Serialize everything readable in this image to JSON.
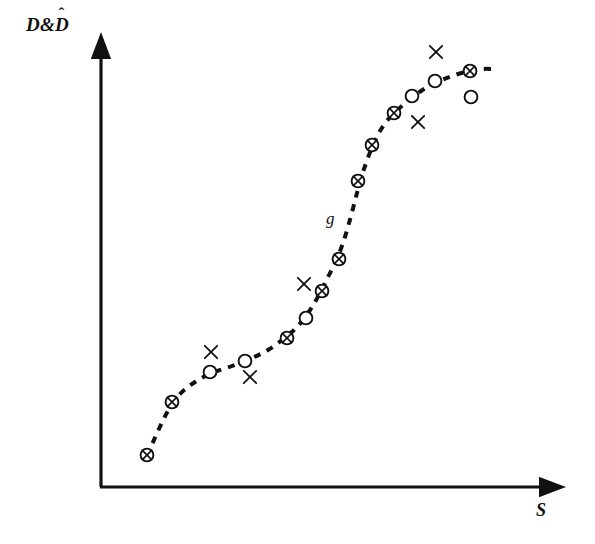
{
  "figure": {
    "width": 595,
    "height": 544,
    "background_color": "#ffffff",
    "ink_color": "#111111"
  },
  "labels": {
    "y_axis": "D&D",
    "y_axis_full": "D&D̂",
    "y_axis_base": "D&",
    "y_axis_hatted_symbol": "D",
    "hat_glyph": "ˆ",
    "x_axis": "S",
    "curve": "g"
  },
  "chart_data": {
    "type": "scatter",
    "title": "",
    "xlabel": "S",
    "ylabel": "D&D̂",
    "grid": false,
    "legend": "none",
    "axes": {
      "style": "arrow",
      "origin_px": [
        100,
        487
      ],
      "y_tip_px": [
        100,
        45
      ],
      "x_tip_px": [
        553,
        487
      ],
      "ticks": [],
      "tick_labels": [],
      "xlim": null,
      "ylim": null
    },
    "annotations": [
      {
        "text": "g",
        "x_px": 334,
        "y_px": 221,
        "style": "italic"
      }
    ],
    "series": [
      {
        "name": "D (fitted curve g)",
        "type": "line",
        "linestyle": "dashed",
        "marker": "none",
        "color": "#111111",
        "points_px": [
          [
            147,
            456
          ],
          [
            158,
            431
          ],
          [
            168,
            411
          ],
          [
            180,
            394
          ],
          [
            195,
            382
          ],
          [
            212,
            373
          ],
          [
            232,
            366
          ],
          [
            252,
            358
          ],
          [
            268,
            350
          ],
          [
            282,
            340
          ],
          [
            294,
            330
          ],
          [
            303,
            320
          ],
          [
            312,
            307
          ],
          [
            320,
            293
          ],
          [
            328,
            277
          ],
          [
            336,
            261
          ],
          [
            344,
            240
          ],
          [
            351,
            216
          ],
          [
            357,
            193
          ],
          [
            363,
            172
          ],
          [
            371,
            150
          ],
          [
            380,
            131
          ],
          [
            392,
            115
          ],
          [
            408,
            101
          ],
          [
            424,
            89
          ],
          [
            442,
            80
          ],
          [
            458,
            74
          ],
          [
            470,
            71
          ],
          [
            483,
            69
          ],
          [
            492,
            69
          ]
        ]
      },
      {
        "name": "Measured and predicted coincident (circle-with-cross)",
        "type": "scatter",
        "marker": "circle-cross",
        "color": "#111111",
        "points_px": [
          [
            147,
            455
          ],
          [
            172,
            402
          ],
          [
            287,
            338
          ],
          [
            322,
            291
          ],
          [
            339,
            259
          ],
          [
            358,
            181
          ],
          [
            372,
            145
          ],
          [
            394,
            113
          ],
          [
            470,
            71
          ]
        ]
      },
      {
        "name": "Predicted D-hat (open circle)",
        "type": "scatter",
        "marker": "circle",
        "color": "#111111",
        "points_px": [
          [
            210,
            372
          ],
          [
            245,
            361
          ],
          [
            306,
            318
          ],
          [
            412,
            96
          ],
          [
            435,
            81
          ],
          [
            471,
            97
          ]
        ]
      },
      {
        "name": "Measured D (cross)",
        "type": "scatter",
        "marker": "cross",
        "color": "#111111",
        "points_px": [
          [
            211,
            352
          ],
          [
            250,
            377
          ],
          [
            304,
            284
          ],
          [
            418,
            122
          ],
          [
            436,
            52
          ]
        ]
      }
    ]
  }
}
